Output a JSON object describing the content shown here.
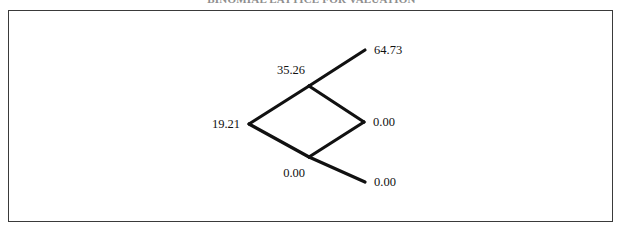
{
  "figure": {
    "title": "BINOMIAL LATTICE FOR VALUATION",
    "frame": {
      "border_color": "#3a3a3a",
      "background": "#ffffff"
    },
    "line_color": "#111111",
    "text_color": "#111111"
  },
  "chart_data": {
    "type": "diagram",
    "subtype": "recombining-binomial-lattice",
    "title": "BINOMIAL LATTICE FOR VALUATION",
    "steps": 2,
    "grid": false,
    "legend": false,
    "nodes": [
      {
        "id": "n0",
        "step": 0,
        "level": 0,
        "value": "19.21",
        "x": 249,
        "y": 124,
        "label_side": "left"
      },
      {
        "id": "n1u",
        "step": 1,
        "level": 1,
        "value": "35.26",
        "x": 309,
        "y": 86,
        "label_side": "above-left"
      },
      {
        "id": "n1d",
        "step": 1,
        "level": -1,
        "value": "0.00",
        "x": 309,
        "y": 157,
        "label_side": "below-left"
      },
      {
        "id": "n2uu",
        "step": 2,
        "level": 2,
        "value": "64.73",
        "x": 365,
        "y": 50,
        "label_side": "right"
      },
      {
        "id": "n2ud",
        "step": 2,
        "level": 0,
        "value": "0.00",
        "x": 364,
        "y": 122,
        "label_side": "right"
      },
      {
        "id": "n2dd",
        "step": 2,
        "level": -2,
        "value": "0.00",
        "x": 365,
        "y": 182,
        "label_side": "right"
      }
    ],
    "edges": [
      {
        "from": "n0",
        "to": "n1u"
      },
      {
        "from": "n0",
        "to": "n1d"
      },
      {
        "from": "n1u",
        "to": "n2uu"
      },
      {
        "from": "n1u",
        "to": "n2ud"
      },
      {
        "from": "n1d",
        "to": "n2ud"
      },
      {
        "from": "n1d",
        "to": "n2dd"
      }
    ],
    "labels": [
      "19.21",
      "35.26",
      "0.00",
      "64.73",
      "0.00",
      "0.00"
    ]
  }
}
